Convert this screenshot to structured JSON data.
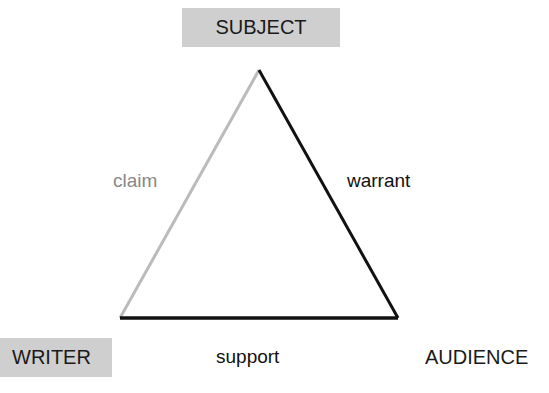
{
  "diagram": {
    "type": "rhetorical-triangle",
    "vertices": {
      "subject": "SUBJECT",
      "writer": "WRITER",
      "audience": "AUDIENCE"
    },
    "edges": {
      "claim": "claim",
      "warrant": "warrant",
      "support": "support"
    },
    "colors": {
      "label_box_fill": "#cfcfcf",
      "claim_edge": "#bbbbbb",
      "warrant_edge": "#111111",
      "support_edge": "#111111",
      "claim_text": "#888888",
      "dark_text": "#111111"
    }
  }
}
